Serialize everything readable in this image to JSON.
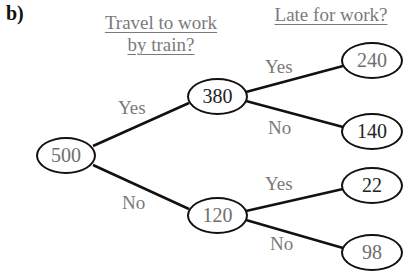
{
  "panel_label": "b)",
  "headings": {
    "train": [
      "Travel to work",
      "by train?"
    ],
    "late": "Late for work?"
  },
  "nodes": {
    "root": "500",
    "train_yes": "380",
    "train_no": "120",
    "yes_late_yes": "240",
    "yes_late_no": "140",
    "no_late_yes": "22",
    "no_late_no": "98"
  },
  "branches": {
    "root_yes": "Yes",
    "root_no": "No",
    "a_yes": "Yes",
    "a_no": "No",
    "b_yes": "Yes",
    "b_no": "No"
  },
  "colors": {
    "text_gray": "#7a7a7a",
    "line": "#111111"
  }
}
